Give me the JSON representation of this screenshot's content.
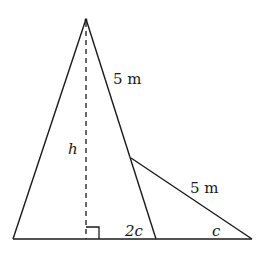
{
  "diagram": {
    "type": "geometry-figure",
    "stroke_color": "#1a1a1a",
    "background": "#ffffff",
    "labels": {
      "upper_side": "5 m",
      "height": "h",
      "lower_side": "5 m",
      "angle_near": "2c",
      "angle_far": "c"
    },
    "points": {
      "apex": [
        86,
        19
      ],
      "base_left": [
        13,
        239
      ],
      "base_mid": [
        156,
        239
      ],
      "base_right": [
        252,
        239
      ],
      "junction": [
        131,
        158
      ],
      "foot": [
        86,
        239
      ]
    },
    "right_angle_marker": true,
    "altitude_dashed": true
  }
}
